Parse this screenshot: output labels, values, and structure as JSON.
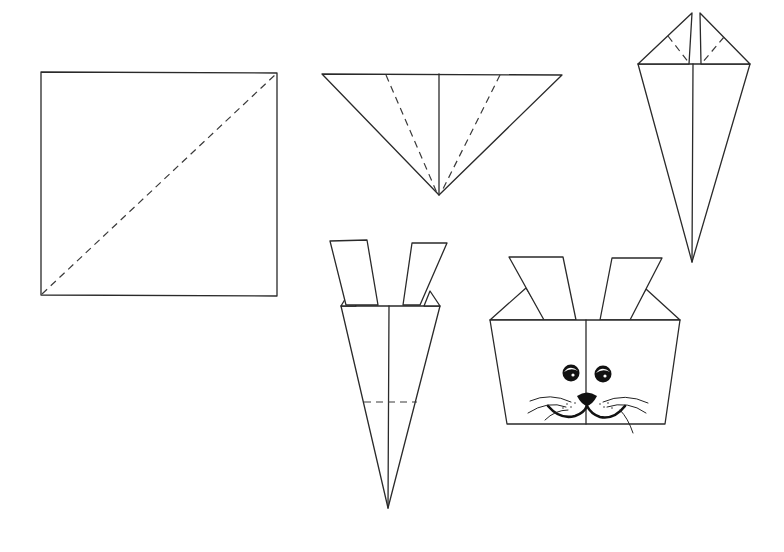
{
  "diagram": {
    "step_count": 5,
    "colors": {
      "background": "#ffffff",
      "line": "#2a2a2a",
      "eye_nose": "#111111"
    },
    "steps": [
      {
        "id": 1,
        "name": "square-with-diagonal-fold",
        "folds": [
          "diagonal-valley-fold"
        ]
      },
      {
        "id": 2,
        "name": "triangle-with-side-folds",
        "folds": [
          "left-side-fold",
          "right-side-fold",
          "center-crease"
        ]
      },
      {
        "id": 3,
        "name": "kite-with-top-flaps",
        "folds": [
          "left-flap-fold",
          "right-flap-fold",
          "center-crease"
        ]
      },
      {
        "id": 4,
        "name": "cone-with-ears",
        "folds": [
          "horizontal-fold"
        ]
      },
      {
        "id": 5,
        "name": "finished-bunny-face",
        "features": [
          "left-ear",
          "right-ear",
          "left-eye",
          "right-eye",
          "nose",
          "mouth",
          "whiskers"
        ]
      }
    ]
  }
}
